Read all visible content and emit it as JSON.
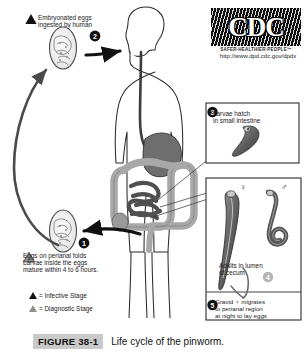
{
  "figure": {
    "tag": "FIGURE 38-1",
    "caption": "Life cycle of the pinworm."
  },
  "logo": {
    "mark_text": "CDC",
    "tagline": "SAFER·HEALTHIER·PEOPLE™",
    "url": "http://www.dpd.cdc.gov/dpdx"
  },
  "steps": {
    "ingested": {
      "number": "2",
      "text": "Embryonated eggs\ningested by human",
      "stage_marker": "infective-triangle"
    },
    "perianal": {
      "number": "1",
      "text": "Eggs on perianal folds\nLarvae inside the eggs\nmature within 4 to 6 hours.",
      "stage_marker": "diagnostic-triangle"
    },
    "larvae_hatch": {
      "number": "3",
      "text": "Larvae hatch\nin small intestine"
    },
    "adults": {
      "number": "4",
      "text": "Adults in lumen\nof cecum"
    },
    "gravid": {
      "number": "5",
      "text": "Gravid ♀ migrates\nto perianal region\nat night to lay eggs"
    }
  },
  "sex_symbols": {
    "female": "♀",
    "male": "♂"
  },
  "legend": {
    "infective": "= Infective Stage",
    "diagnostic": "= Diagnostic Stage"
  },
  "colors": {
    "background": "#ffffff",
    "ink": "#1a1a1a",
    "arrow": "#111111",
    "stomach": "#6e6e6e",
    "colon": "#a8a8a8",
    "small_intestine": "#4f4f4f",
    "egg_outline": "#555555",
    "caption_tag_bg": "#c9c9c9"
  }
}
